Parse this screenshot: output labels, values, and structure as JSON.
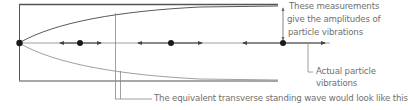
{
  "diagram": {
    "type": "standing-wave-longitudinal",
    "colors": {
      "frame": "#555555",
      "envelope_upper": "#5a5a5a",
      "envelope_lower": "#9a9a9a",
      "axis": "#777777",
      "particle": "#1a1a1a",
      "arrow": "#444444",
      "callout": "#8a8a8a",
      "text": "#6f6f6f"
    },
    "particles": [
      {
        "x": 19,
        "y": 43,
        "role": "node"
      },
      {
        "x": 80,
        "y": 43,
        "arrow_left": 60,
        "arrow_right": 101
      },
      {
        "x": 171,
        "y": 43,
        "arrow_left": 138,
        "arrow_right": 202
      },
      {
        "x": 283,
        "y": 43,
        "arrow_left": 243,
        "arrow_right": 325
      }
    ]
  },
  "labels": {
    "amplitude_line1": "These measurements",
    "amplitude_line2": "give the amplitudes of",
    "amplitude_line3": "particle vibrations",
    "actual_line1": "Actual particle",
    "actual_line2": "vibrations",
    "transverse": "The equivalent transverse standing wave would look like this"
  }
}
